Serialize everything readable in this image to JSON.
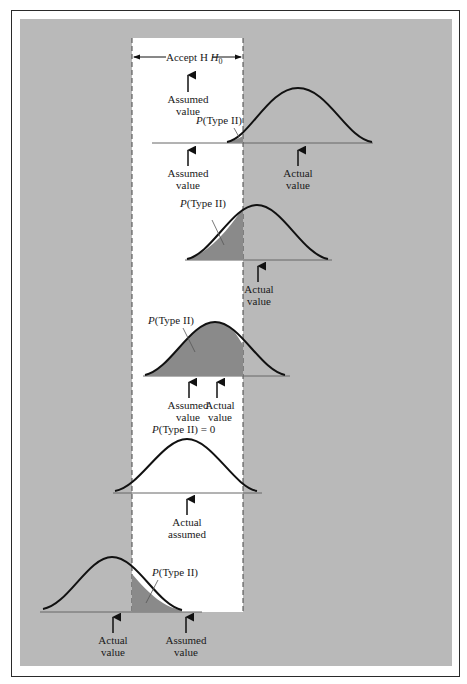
{
  "figure": {
    "band_label": "Accept H",
    "band_label_sub": "0",
    "band_assumed_label": [
      "Assumed",
      "value"
    ],
    "colors": {
      "background": "#b9b9b9",
      "accept_band": "#ffffff",
      "shade": "#8a8a8a",
      "curve": "#111111",
      "frame": "#2a2a2a"
    }
  },
  "panels": [
    {
      "p_label": "P(Type II)",
      "left_arrow": [
        "Assumed",
        "value"
      ],
      "right_arrow": [
        "Actual",
        "value"
      ]
    },
    {
      "p_label": "P(Type II)",
      "arrow": [
        "Actual",
        "value"
      ]
    },
    {
      "p_label": "P(Type II)",
      "left_arrow": [
        "Assumed",
        "value"
      ],
      "right_arrow": [
        "Actual",
        "value"
      ]
    },
    {
      "p_label": "P(Type II) = 0",
      "arrow": [
        "Actual",
        "assumed"
      ]
    },
    {
      "p_label": "P(Type II)",
      "left_arrow": [
        "Actual",
        "value"
      ],
      "right_arrow": [
        "Assumed",
        "value"
      ]
    }
  ]
}
